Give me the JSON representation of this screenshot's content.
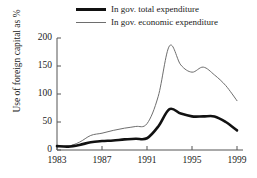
{
  "chart_data": {
    "type": "line",
    "title": "",
    "xlabel": "",
    "ylabel": "Use of foreign capital as %",
    "xlim": [
      1983,
      1999
    ],
    "ylim": [
      0,
      200
    ],
    "grid": false,
    "legend_position": "top",
    "xticks": [
      "1983",
      "1987",
      "1991",
      "1995",
      "1999"
    ],
    "xtick_values": [
      1983,
      1987,
      1991,
      1995,
      1999
    ],
    "yticks": [
      "0",
      "50",
      "100",
      "150",
      "200"
    ],
    "ytick_values": [
      0,
      50,
      100,
      150,
      200
    ],
    "x": [
      1983,
      1984,
      1985,
      1986,
      1987,
      1988,
      1989,
      1990,
      1991,
      1992,
      1993,
      1994,
      1995,
      1996,
      1997,
      1998,
      1999
    ],
    "series": [
      {
        "name": "In gov. total expenditure",
        "color": "#111111",
        "width": 2.6,
        "values": [
          7,
          6,
          9,
          14,
          16,
          17,
          19,
          20,
          21,
          42,
          73,
          65,
          60,
          60,
          60,
          50,
          35
        ]
      },
      {
        "name": "In gov. economic expenditure",
        "color": "#6e6e6e",
        "width": 1.0,
        "values": [
          8,
          7,
          14,
          26,
          30,
          35,
          39,
          42,
          47,
          96,
          186,
          152,
          139,
          148,
          134,
          115,
          88
        ]
      }
    ]
  },
  "legend": {
    "items": [
      {
        "label": "In gov. total expenditure",
        "style": "thick"
      },
      {
        "label": "In gov. economic expenditure",
        "style": "thin"
      }
    ]
  },
  "axes": {
    "axis_color": "#555555",
    "y_title": "Use of foreign capital as %"
  }
}
